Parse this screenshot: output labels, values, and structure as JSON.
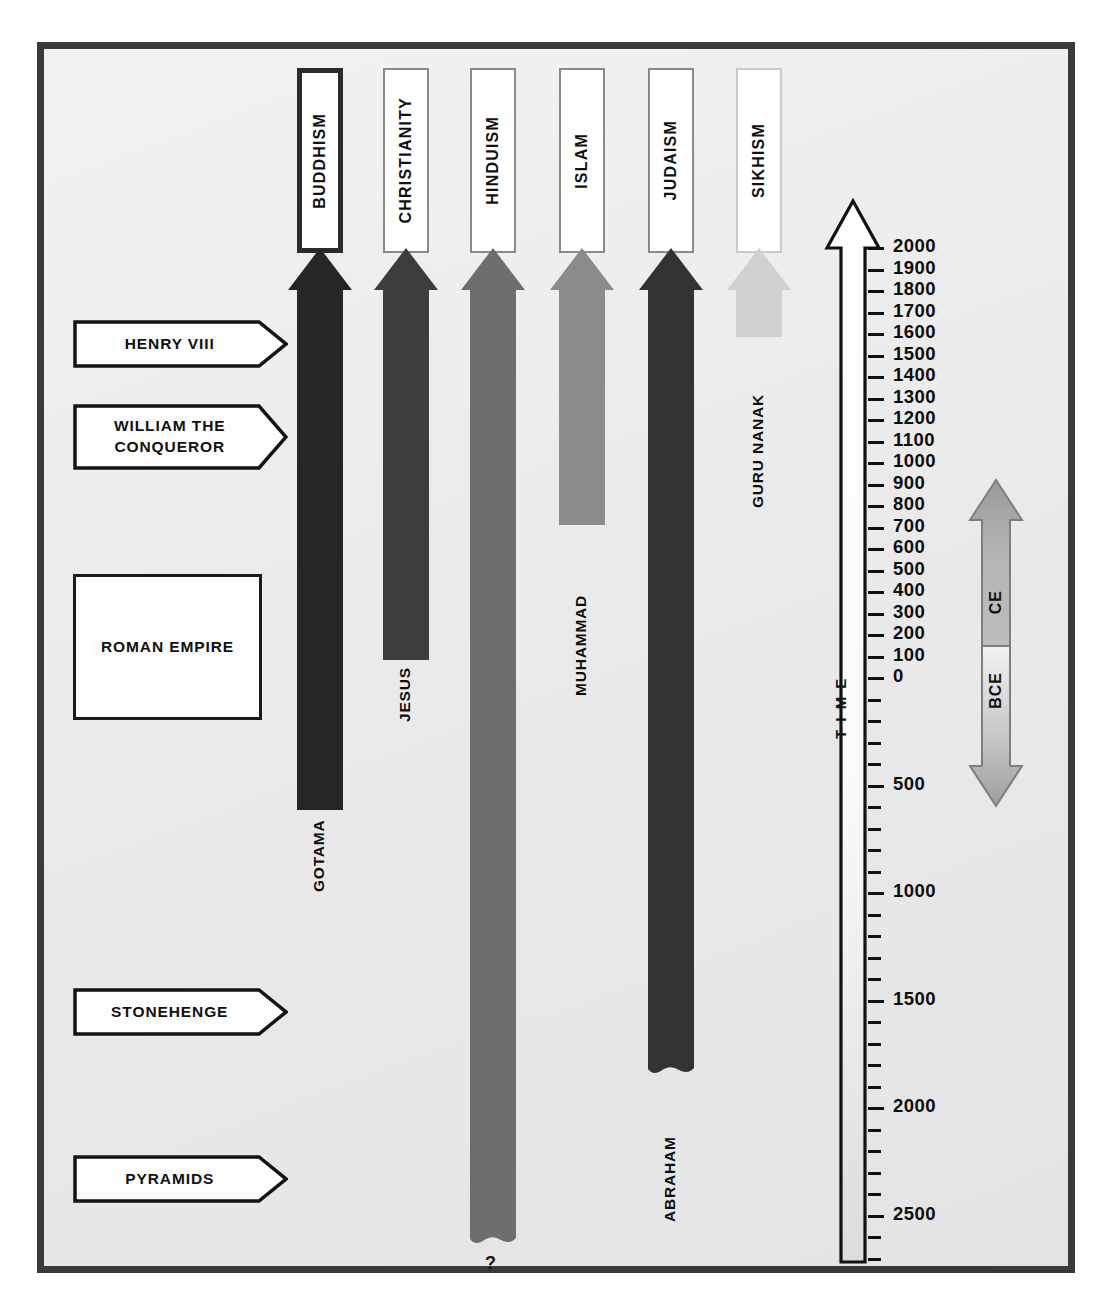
{
  "diagram": {
    "frame_color": "#3a3a3a",
    "background_color": "#ececed"
  },
  "religions": [
    {
      "name": "BUDDHISM",
      "color": "#262626",
      "founder": "GOTAMA",
      "box_highlighted": true,
      "start_label": "GOTAMA",
      "end_style": "flat",
      "start_year_bce": 500
    },
    {
      "name": "CHRISTIANITY",
      "color": "#3d3d3d",
      "founder": "JESUS",
      "box_highlighted": false,
      "start_label": "JESUS",
      "end_style": "flat",
      "start_year_ce": 30
    },
    {
      "name": "HINDUISM",
      "color": "#6e6e6e",
      "founder": "?",
      "box_highlighted": false,
      "start_label": "?",
      "end_style": "wavy",
      "start_year_bce": 2800
    },
    {
      "name": "ISLAM",
      "color": "#8c8c8c",
      "founder": "MUHAMMAD",
      "box_highlighted": false,
      "start_label": "MUHAMMAD",
      "end_style": "flat",
      "start_year_ce": 610
    },
    {
      "name": "JUDAISM",
      "color": "#333333",
      "founder": "ABRAHAM",
      "box_highlighted": false,
      "start_label": "ABRAHAM",
      "end_style": "wavy",
      "start_year_bce": 1900
    },
    {
      "name": "SIKHISM",
      "color": "#d0d0d0",
      "founder": "GURU NANAK",
      "box_highlighted": false,
      "start_label": "GURU NANAK",
      "end_style": "flat",
      "start_year_ce": 1500
    }
  ],
  "events": [
    {
      "label": "HENRY VIII",
      "shape": "pentagon"
    },
    {
      "label": "WILLIAM THE\nCONQUEROR",
      "line1": "WILLIAM THE",
      "line2": "CONQUEROR",
      "shape": "pentagon"
    },
    {
      "label": "ROMAN EMPIRE",
      "shape": "rectangle"
    },
    {
      "label": "STONEHENGE",
      "shape": "pentagon"
    },
    {
      "label": "PYRAMIDS",
      "shape": "pentagon"
    }
  ],
  "time_axis": {
    "label": "T I M E",
    "letters": [
      "T",
      "I",
      "M",
      "E"
    ],
    "ce_labels": [
      "2000",
      "1900",
      "1800",
      "1700",
      "1600",
      "1500",
      "1400",
      "1300",
      "1200",
      "1100",
      "1000",
      "900",
      "800",
      "700",
      "600",
      "500",
      "400",
      "300",
      "200",
      "100",
      "0"
    ],
    "bce_major_labels": [
      "500",
      "1000",
      "1500",
      "2000",
      "2500"
    ],
    "tick_interval_years": 100,
    "top_year": 2000,
    "bottom_year_bce": 2800
  },
  "legend": {
    "upper_label": "CE",
    "lower_label": "BCE"
  },
  "chart_data": {
    "type": "bar",
    "xlabel": "Religion",
    "ylabel": "TIME",
    "ylim": [
      -2800,
      2000
    ],
    "categories": [
      "BUDDHISM",
      "CHRISTIANITY",
      "HINDUISM",
      "ISLAM",
      "JUDAISM",
      "SIKHISM"
    ],
    "values": [
      -500,
      30,
      -2800,
      610,
      -1900,
      1500
    ],
    "value_note": "Approximate founding year; negative = BCE",
    "founders": [
      "GOTAMA",
      "JESUS",
      "?",
      "MUHAMMAD",
      "ABRAHAM",
      "GURU NANAK"
    ],
    "colors": [
      "#262626",
      "#3d3d3d",
      "#6e6e6e",
      "#8c8c8c",
      "#333333",
      "#d0d0d0"
    ],
    "annotations": [
      "HENRY VIII",
      "WILLIAM THE CONQUEROR",
      "ROMAN EMPIRE",
      "STONEHENGE",
      "PYRAMIDS"
    ],
    "legend": [
      "CE",
      "BCE"
    ],
    "grid": false
  }
}
